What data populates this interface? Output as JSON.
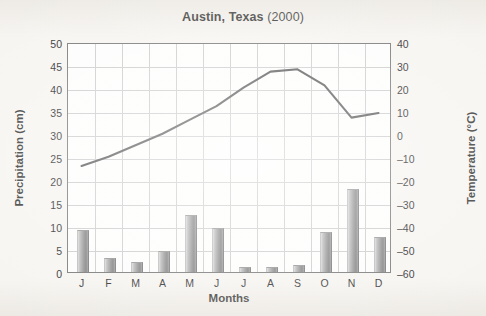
{
  "chart_data": {
    "type": "bar",
    "title": "Austin, Texas (2000)",
    "title_bold_part": "Austin, Texas",
    "title_year_part": "(2000)",
    "xlabel": "Months",
    "categories": [
      "J",
      "F",
      "M",
      "A",
      "M",
      "J",
      "J",
      "A",
      "S",
      "O",
      "N",
      "D"
    ],
    "grid": true,
    "legend": "none",
    "series": [
      {
        "name": "Precipitation (cm)",
        "type": "bar",
        "axis": "left",
        "ylabel": "Precipitation (cm)",
        "ylim": [
          0,
          50
        ],
        "ytick_step": 5,
        "yticks": [
          "0",
          "5",
          "10",
          "15",
          "20",
          "25",
          "30",
          "35",
          "40",
          "45",
          "50"
        ],
        "values": [
          9.0,
          2.8,
          2.0,
          4.3,
          12.2,
          9.3,
          0.8,
          0.9,
          1.4,
          8.5,
          17.8,
          7.3
        ],
        "color": "#8e8e8e"
      },
      {
        "name": "Temperature (°C)",
        "type": "line",
        "axis": "right",
        "ylabel": "Temperature (°C)",
        "ylim": [
          -60,
          40
        ],
        "ytick_step": 10,
        "yticks": [
          "-60",
          "-50",
          "-40",
          "-30",
          "-20",
          "-10",
          "0",
          "10",
          "20",
          "30",
          "40"
        ],
        "values": [
          -13,
          -9,
          -4,
          1,
          7,
          13,
          21,
          28,
          29,
          22,
          8,
          10
        ],
        "color": "#4a4a4a"
      }
    ]
  },
  "axes": {
    "left_title": "Precipitation (cm)",
    "right_title": "Temperature (°C)",
    "x_title": "Months"
  }
}
